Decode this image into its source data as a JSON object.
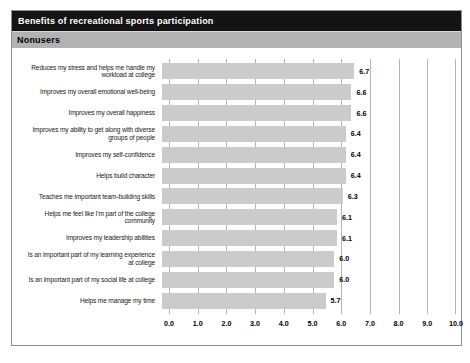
{
  "chart_data": {
    "type": "bar",
    "orientation": "horizontal",
    "title": "Benefits of recreational sports participation",
    "subtitle": "Nonusers",
    "categories": [
      "Reduces my stress and helps me handle my\nworkload at college",
      "Improves my overall emotional well-being",
      "Improves my overall happiness",
      "Improves my ability to get along with diverse\ngroups of people",
      "Improves my self-confidence",
      "Helps build character",
      "Teaches me important team-building skills",
      "Helps me feel like I'm part of the college\ncommunity",
      "Improves my leadership abilities",
      "Is an important part of my learning experience\nat college",
      "Is an important part of my social life at college",
      "Helps me manage my time"
    ],
    "values": [
      6.7,
      6.6,
      6.6,
      6.4,
      6.4,
      6.4,
      6.3,
      6.1,
      6.1,
      6.0,
      6.0,
      5.7
    ],
    "value_labels": [
      "6.7",
      "6.6",
      "6.6",
      "6.4",
      "6.4",
      "6.4",
      "6.3",
      "6.1",
      "6.1",
      "6.0",
      "6.0",
      "5.7"
    ],
    "xlim": [
      0,
      10
    ],
    "x_ticks": [
      "0.0",
      "1.0",
      "2.0",
      "3.0",
      "4.0",
      "5.0",
      "6.0",
      "7.0",
      "8.0",
      "9.0",
      "10.0"
    ],
    "grid": "vertical",
    "legend": "none",
    "colors": {
      "bar_fill": "#cbcbcb",
      "gridline": "#b5b5b5",
      "title_bar_bg": "#141414",
      "title_text": "#ffffff",
      "subtitle_bar_bg": "#b2b2b2",
      "subtitle_text": "#000000",
      "panel_border": "#8f8f8f"
    }
  }
}
